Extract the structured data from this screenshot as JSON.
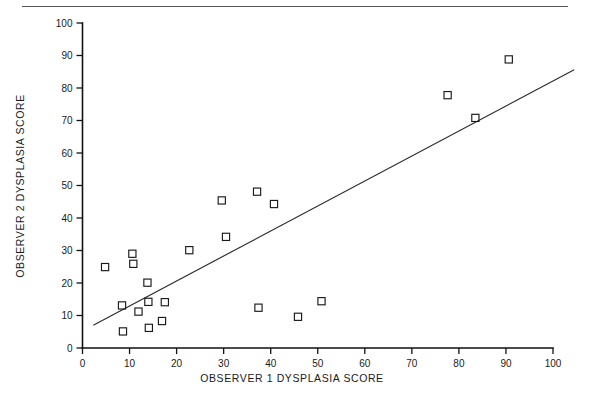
{
  "figure": {
    "background_color": "#ffffff",
    "ink_color": "#1a1a1a",
    "top_rule_color": "#555555",
    "marker_shape": "open-square"
  },
  "chart_data": {
    "type": "scatter",
    "title": "",
    "subtitle": "",
    "xlabel": "OBSERVER 1 DYSPLASIA SCORE",
    "ylabel": "OBSERVER 2 DYSPLASIA SCORE",
    "xlim": [
      0,
      100
    ],
    "ylim": [
      0,
      100
    ],
    "grid": false,
    "legend": null,
    "xticks": [
      0,
      10,
      20,
      30,
      40,
      50,
      60,
      70,
      80,
      90,
      100
    ],
    "yticks": [
      0,
      10,
      20,
      30,
      40,
      50,
      60,
      70,
      80,
      90,
      100
    ],
    "xtick_labels": [
      "0",
      "10",
      "20",
      "30",
      "40",
      "50",
      "60",
      "70",
      "80",
      "90",
      "100"
    ],
    "ytick_labels": [
      "0",
      "10",
      "20",
      "30",
      "40",
      "50",
      "60",
      "70",
      "80",
      "90",
      "100"
    ],
    "series": [
      {
        "name": "observer-pairs",
        "marker": "open-square",
        "x": [
          4.8,
          8.4,
          8.6,
          10.6,
          10.8,
          11.9,
          13.8,
          14.0,
          14.1,
          16.9,
          17.5,
          22.7,
          29.6,
          30.5,
          37.1,
          37.4,
          40.7,
          45.8,
          50.8,
          77.6,
          83.5,
          90.6
        ],
        "y": [
          24.9,
          13.1,
          5.1,
          29.0,
          25.9,
          11.2,
          20.1,
          14.2,
          6.2,
          8.3,
          14.1,
          30.1,
          45.4,
          34.2,
          48.1,
          12.4,
          44.3,
          9.6,
          14.4,
          77.8,
          70.8,
          88.8
        ]
      }
    ],
    "fit_line": {
      "name": "regression-line",
      "x_start": 2.3,
      "y_start": 7.0,
      "x_end": 104.5,
      "y_end": 85.6
    }
  }
}
